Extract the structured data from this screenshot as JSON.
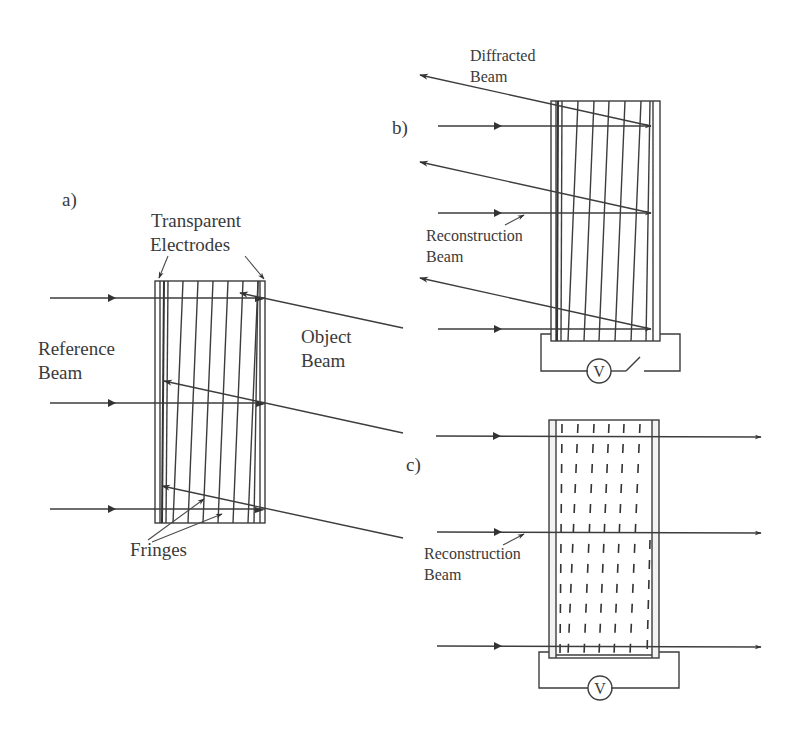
{
  "figure": {
    "panels": [
      {
        "id": "a",
        "label": "a)",
        "annotations": {
          "electrodes": "Transparent",
          "electrodes_line2": "Electrodes",
          "reference": "Reference",
          "reference_line2": "Beam",
          "object": "Object",
          "object_line2": "Beam",
          "fringes": "Fringes"
        }
      },
      {
        "id": "b",
        "label": "b)",
        "annotations": {
          "diffracted": "Diffracted",
          "diffracted_line2": "Beam",
          "reconstruction": "Reconstruction",
          "reconstruction_line2": "Beam",
          "voltmeter": "V"
        },
        "switch_state": "open"
      },
      {
        "id": "c",
        "label": "c)",
        "annotations": {
          "reconstruction": "Reconstruction",
          "reconstruction_line2": "Beam",
          "voltmeter": "V"
        }
      }
    ],
    "colors": {
      "line": "#3d3d3d",
      "text": "#3a3a3a",
      "background": "#ffffff"
    }
  }
}
